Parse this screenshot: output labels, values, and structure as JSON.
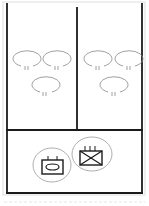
{
  "diagram": {
    "type": "unit-layout",
    "sections": [
      {
        "id": "upper-left",
        "symbols": [
          "oval",
          "oval",
          "oval"
        ]
      },
      {
        "id": "upper-right",
        "symbols": [
          "oval",
          "oval",
          "oval"
        ]
      },
      {
        "id": "lower",
        "symbols": [
          "unit-oval-in-box",
          "unit-x-in-box"
        ]
      }
    ],
    "colors": {
      "line": "#1a1a1a",
      "symbol": "#888888"
    }
  }
}
